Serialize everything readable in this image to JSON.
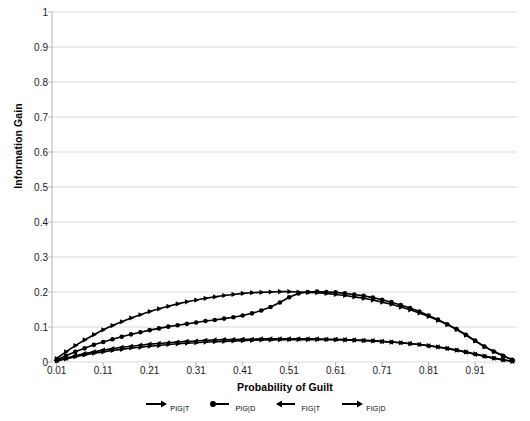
{
  "chart_data": {
    "type": "line",
    "title": "",
    "xlabel": "Probability of Guilt",
    "ylabel": "Information Gain",
    "xlim": [
      0.0,
      1.0
    ],
    "ylim": [
      0,
      1
    ],
    "grid": true,
    "legend_position": "bottom",
    "y_ticks": [
      "0",
      "0.1",
      "0.2",
      "0.3",
      "0.4",
      "0.5",
      "0.6",
      "0.7",
      "0.8",
      "0.9",
      "1"
    ],
    "x_ticks": [
      "0.01",
      "0.11",
      "0.21",
      "0.31",
      "0.41",
      "0.51",
      "0.61",
      "0.71",
      "0.81",
      "0.91"
    ],
    "marker": "triangle",
    "color": "#000000",
    "x": [
      0.01,
      0.03,
      0.05,
      0.07,
      0.09,
      0.11,
      0.13,
      0.15,
      0.17,
      0.19,
      0.21,
      0.23,
      0.25,
      0.27,
      0.29,
      0.31,
      0.33,
      0.35,
      0.37,
      0.39,
      0.41,
      0.43,
      0.45,
      0.47,
      0.49,
      0.51,
      0.53,
      0.55,
      0.57,
      0.59,
      0.61,
      0.63,
      0.65,
      0.67,
      0.69,
      0.71,
      0.73,
      0.75,
      0.77,
      0.79,
      0.81,
      0.83,
      0.85,
      0.87,
      0.89,
      0.91,
      0.93,
      0.95,
      0.97,
      0.99
    ],
    "series": [
      {
        "name": "PIG|T",
        "label": "PIG|T",
        "marker": "triangle-right",
        "values": [
          0.01,
          0.029,
          0.047,
          0.063,
          0.078,
          0.092,
          0.104,
          0.115,
          0.126,
          0.135,
          0.144,
          0.152,
          0.159,
          0.166,
          0.172,
          0.177,
          0.182,
          0.186,
          0.19,
          0.193,
          0.196,
          0.198,
          0.199,
          0.2,
          0.201,
          0.201,
          0.2,
          0.199,
          0.198,
          0.196,
          0.193,
          0.19,
          0.186,
          0.182,
          0.177,
          0.171,
          0.165,
          0.157,
          0.149,
          0.14,
          0.13,
          0.119,
          0.107,
          0.093,
          0.077,
          0.06,
          0.044,
          0.03,
          0.018,
          0.006
        ]
      },
      {
        "name": "PIG|D",
        "label": "PIG|D",
        "marker": "circle",
        "values": [
          0.006,
          0.018,
          0.029,
          0.039,
          0.049,
          0.057,
          0.065,
          0.072,
          0.079,
          0.085,
          0.091,
          0.096,
          0.101,
          0.105,
          0.109,
          0.113,
          0.117,
          0.12,
          0.124,
          0.128,
          0.133,
          0.139,
          0.147,
          0.157,
          0.17,
          0.185,
          0.196,
          0.2,
          0.201,
          0.2,
          0.199,
          0.196,
          0.193,
          0.189,
          0.184,
          0.178,
          0.171,
          0.163,
          0.154,
          0.144,
          0.133,
          0.121,
          0.108,
          0.094,
          0.078,
          0.061,
          0.044,
          0.03,
          0.018,
          0.006
        ]
      },
      {
        "name": "FIG|T",
        "label": "FIG|T",
        "marker": "triangle-left",
        "values": [
          0.004,
          0.011,
          0.018,
          0.024,
          0.029,
          0.034,
          0.038,
          0.042,
          0.045,
          0.048,
          0.051,
          0.053,
          0.055,
          0.057,
          0.059,
          0.06,
          0.062,
          0.063,
          0.064,
          0.064,
          0.065,
          0.065,
          0.066,
          0.066,
          0.066,
          0.066,
          0.066,
          0.066,
          0.066,
          0.065,
          0.065,
          0.064,
          0.063,
          0.062,
          0.061,
          0.059,
          0.057,
          0.055,
          0.053,
          0.05,
          0.046,
          0.043,
          0.038,
          0.034,
          0.028,
          0.022,
          0.016,
          0.011,
          0.006,
          0.002
        ]
      },
      {
        "name": "FIG|D",
        "label": "FIG|D",
        "marker": "triangle-right",
        "values": [
          0.003,
          0.009,
          0.015,
          0.02,
          0.025,
          0.029,
          0.033,
          0.036,
          0.04,
          0.042,
          0.045,
          0.047,
          0.05,
          0.052,
          0.054,
          0.055,
          0.057,
          0.058,
          0.059,
          0.06,
          0.061,
          0.062,
          0.063,
          0.063,
          0.064,
          0.064,
          0.064,
          0.064,
          0.064,
          0.064,
          0.063,
          0.063,
          0.062,
          0.061,
          0.06,
          0.058,
          0.057,
          0.055,
          0.052,
          0.05,
          0.047,
          0.043,
          0.039,
          0.034,
          0.029,
          0.023,
          0.017,
          0.011,
          0.006,
          0.002
        ]
      }
    ]
  },
  "legend": {
    "items": [
      {
        "label": "PIG|T",
        "symbol": "line-arrow-right"
      },
      {
        "label": "PIG|D",
        "symbol": "line-circle-left"
      },
      {
        "label": "FIG|T",
        "symbol": "line-arrow-left"
      },
      {
        "label": "FIG|D",
        "symbol": "line-arrow-right"
      }
    ]
  },
  "axes": {
    "x_title": "Probability of Guilt",
    "y_title": "Information Gain"
  }
}
